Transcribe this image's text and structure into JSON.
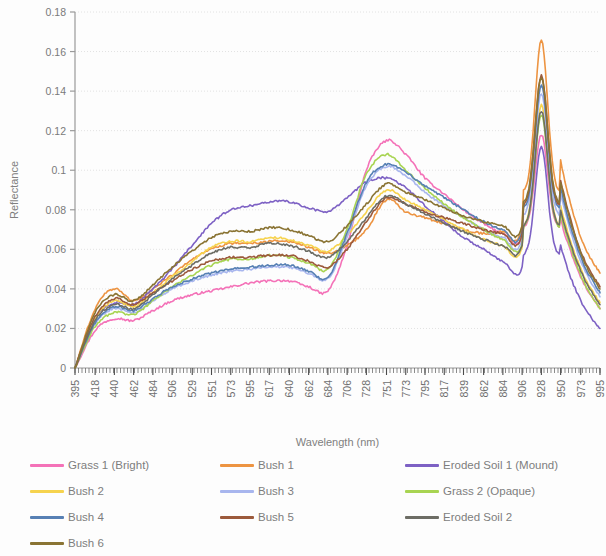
{
  "chart_data": {
    "type": "line",
    "title": "",
    "xlabel": "Wavelength (nm)",
    "ylabel": "Reflectance",
    "xlim": [
      395,
      995
    ],
    "ylim": [
      0,
      0.18
    ],
    "ytick_step": 0.02,
    "grid": true,
    "legend_position": "bottom",
    "ytick_labels": [
      "0",
      "0.02",
      "0.04",
      "0.06",
      "0.08",
      "0.1",
      "0.12",
      "0.14",
      "0.16",
      "0.18"
    ],
    "ytick_values": [
      0,
      0.02,
      0.04,
      0.06,
      0.08,
      0.1,
      0.12,
      0.14,
      0.16,
      0.18
    ],
    "xtick_labels": [
      "395",
      "418",
      "440",
      "462",
      "484",
      "506",
      "529",
      "551",
      "573",
      "595",
      "617",
      "640",
      "662",
      "684",
      "706",
      "728",
      "751",
      "773",
      "795",
      "817",
      "839",
      "862",
      "884",
      "906",
      "928",
      "950",
      "973",
      "995"
    ],
    "x": [
      395,
      418,
      440,
      462,
      484,
      506,
      529,
      551,
      573,
      595,
      617,
      640,
      662,
      684,
      706,
      728,
      751,
      773,
      795,
      817,
      839,
      862,
      884,
      906,
      928,
      950,
      973,
      995
    ],
    "series": [
      {
        "name": "Grass 1 (Bright)",
        "color": "#f472b8",
        "values": [
          0.0,
          0.019,
          0.025,
          0.024,
          0.029,
          0.034,
          0.037,
          0.039,
          0.041,
          0.043,
          0.044,
          0.044,
          0.041,
          0.039,
          0.062,
          0.1,
          0.115,
          0.108,
          0.096,
          0.088,
          0.08,
          0.073,
          0.068,
          0.066,
          0.118,
          0.075,
          0.046,
          0.03
        ]
      },
      {
        "name": "Bush 1",
        "color": "#ed9442",
        "values": [
          0.0,
          0.03,
          0.04,
          0.034,
          0.04,
          0.047,
          0.055,
          0.06,
          0.063,
          0.063,
          0.064,
          0.064,
          0.061,
          0.058,
          0.062,
          0.07,
          0.085,
          0.079,
          0.076,
          0.073,
          0.07,
          0.068,
          0.069,
          0.072,
          0.166,
          0.105,
          0.066,
          0.048
        ]
      },
      {
        "name": "Eroded Soil 1 (Mound)",
        "color": "#7d61c4",
        "values": [
          0.0,
          0.025,
          0.033,
          0.032,
          0.04,
          0.05,
          0.062,
          0.073,
          0.08,
          0.082,
          0.084,
          0.084,
          0.081,
          0.079,
          0.086,
          0.094,
          0.096,
          0.091,
          0.082,
          0.074,
          0.066,
          0.06,
          0.054,
          0.051,
          0.112,
          0.062,
          0.034,
          0.02
        ]
      },
      {
        "name": "Bush 2",
        "color": "#f6d34e",
        "values": [
          0.0,
          0.025,
          0.034,
          0.031,
          0.038,
          0.046,
          0.054,
          0.061,
          0.064,
          0.064,
          0.066,
          0.065,
          0.062,
          0.059,
          0.067,
          0.079,
          0.09,
          0.085,
          0.08,
          0.075,
          0.07,
          0.065,
          0.062,
          0.061,
          0.133,
          0.082,
          0.05,
          0.033
        ]
      },
      {
        "name": "Bush 3",
        "color": "#a8b6ee",
        "values": [
          0.0,
          0.022,
          0.03,
          0.028,
          0.034,
          0.04,
          0.044,
          0.047,
          0.049,
          0.05,
          0.051,
          0.051,
          0.048,
          0.045,
          0.066,
          0.092,
          0.102,
          0.097,
          0.089,
          0.082,
          0.076,
          0.07,
          0.066,
          0.065,
          0.139,
          0.088,
          0.054,
          0.036
        ]
      },
      {
        "name": "Grass 2 (Opaque)",
        "color": "#a8d452",
        "values": [
          0.0,
          0.021,
          0.028,
          0.027,
          0.034,
          0.041,
          0.047,
          0.052,
          0.055,
          0.055,
          0.057,
          0.056,
          0.053,
          0.05,
          0.07,
          0.098,
          0.108,
          0.1,
          0.091,
          0.083,
          0.076,
          0.07,
          0.065,
          0.063,
          0.128,
          0.078,
          0.047,
          0.03
        ]
      },
      {
        "name": "Bush 4",
        "color": "#5780b4",
        "values": [
          0.0,
          0.023,
          0.031,
          0.029,
          0.035,
          0.041,
          0.045,
          0.048,
          0.05,
          0.051,
          0.052,
          0.052,
          0.049,
          0.046,
          0.068,
          0.094,
          0.103,
          0.099,
          0.092,
          0.086,
          0.08,
          0.074,
          0.07,
          0.069,
          0.143,
          0.091,
          0.056,
          0.038
        ]
      },
      {
        "name": "Bush 5",
        "color": "#9c5a3c",
        "values": [
          0.0,
          0.026,
          0.035,
          0.032,
          0.038,
          0.044,
          0.05,
          0.054,
          0.056,
          0.056,
          0.057,
          0.057,
          0.054,
          0.051,
          0.06,
          0.074,
          0.086,
          0.083,
          0.079,
          0.076,
          0.073,
          0.07,
          0.068,
          0.068,
          0.148,
          0.095,
          0.059,
          0.041
        ]
      },
      {
        "name": "Eroded Soil 2",
        "color": "#6d6d65",
        "values": [
          0.0,
          0.024,
          0.032,
          0.03,
          0.037,
          0.045,
          0.052,
          0.058,
          0.061,
          0.061,
          0.063,
          0.062,
          0.059,
          0.056,
          0.064,
          0.076,
          0.087,
          0.083,
          0.078,
          0.073,
          0.069,
          0.065,
          0.062,
          0.062,
          0.13,
          0.08,
          0.049,
          0.032
        ]
      },
      {
        "name": "Bush 6",
        "color": "#8a7434",
        "values": [
          0.0,
          0.028,
          0.037,
          0.034,
          0.042,
          0.051,
          0.059,
          0.066,
          0.069,
          0.069,
          0.071,
          0.07,
          0.067,
          0.064,
          0.072,
          0.083,
          0.093,
          0.089,
          0.085,
          0.081,
          0.077,
          0.074,
          0.072,
          0.072,
          0.147,
          0.094,
          0.058,
          0.04
        ]
      }
    ]
  },
  "legend": {
    "rows": [
      [
        {
          "label": "Grass 1 (Bright)",
          "color": "#f472b8"
        },
        {
          "label": "Bush 1",
          "color": "#ed9442"
        },
        {
          "label": "Eroded Soil 1 (Mound)",
          "color": "#7d61c4"
        }
      ],
      [
        {
          "label": "Bush 2",
          "color": "#f6d34e"
        },
        {
          "label": "Bush 3",
          "color": "#a8b6ee"
        },
        {
          "label": "Grass 2 (Opaque)",
          "color": "#a8d452"
        }
      ],
      [
        {
          "label": "Bush 4",
          "color": "#5780b4"
        },
        {
          "label": "Bush 5",
          "color": "#9c5a3c"
        },
        {
          "label": "Eroded Soil 2",
          "color": "#6d6d65"
        }
      ],
      [
        {
          "label": "Bush 6",
          "color": "#8a7434"
        }
      ]
    ]
  }
}
